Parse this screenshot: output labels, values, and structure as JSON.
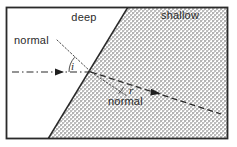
{
  "figure": {
    "type": "physics-ray-diagram",
    "frame": {
      "border_color": "#2a2a2a",
      "background_color": "#ffffff",
      "x": 6,
      "y": 7,
      "width": 222,
      "height": 132
    },
    "regions": [
      {
        "name": "deep",
        "label": "deep",
        "shaded": false,
        "fill_color": "#ffffff",
        "label_x": 84,
        "label_y": 21
      },
      {
        "name": "shallow",
        "label": "shallow",
        "shaded": true,
        "fill_color": "#c9c9c9",
        "label_x": 180,
        "label_y": 19
      }
    ],
    "boundary": {
      "name": "boundary-line",
      "color": "#2a2a2a",
      "x1": 128,
      "y1": 7,
      "x2": 48,
      "y2": 139
    },
    "normals": [
      {
        "name": "normal-incident",
        "label": "normal",
        "style": "dotted",
        "color": "#3a3a3a",
        "label_x": 14,
        "label_y": 44,
        "x1": 57,
        "y1": 40,
        "x2": 91,
        "y2": 72
      },
      {
        "name": "normal-refracted",
        "label": "normal",
        "style": "dotted",
        "color": "#3a3a3a",
        "label_x": 108,
        "label_y": 105,
        "x1": 91,
        "y1": 72,
        "x2": 126,
        "y2": 95
      }
    ],
    "rays": [
      {
        "name": "incident-ray",
        "style": "dash-dot",
        "color": "#2a2a2a",
        "x1": 12,
        "y1": 72,
        "x2": 91,
        "y2": 72,
        "arrow_x": 62,
        "arrow_y": 72,
        "direction": "right"
      },
      {
        "name": "refracted-ray",
        "style": "dashed",
        "color": "#2a2a2a",
        "x1": 91,
        "y1": 72,
        "x2": 221,
        "y2": 114,
        "arrow_x": 160,
        "arrow_y": 94,
        "direction": "down-right"
      }
    ],
    "angles": [
      {
        "name": "angle-of-incidence",
        "label": "i",
        "label_x": 71,
        "label_y": 70,
        "arc_radius": 26,
        "vertex_x": 91,
        "vertex_y": 72
      },
      {
        "name": "angle-of-refraction",
        "label": "r",
        "label_x": 129,
        "label_y": 94,
        "arc_radius": 38,
        "vertex_x": 91,
        "vertex_y": 72
      }
    ],
    "intersection_point": {
      "x": 91,
      "y": 72
    }
  }
}
